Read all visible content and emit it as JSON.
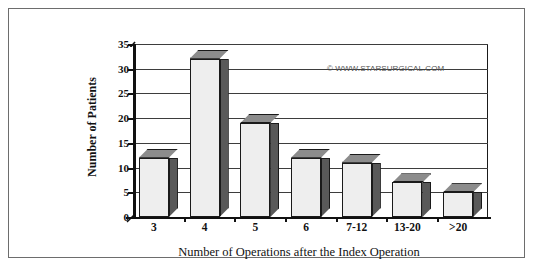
{
  "chart_data": {
    "type": "bar",
    "title": "",
    "xlabel": "Number of  Operations after the Index Operation",
    "ylabel": "Number of Patients",
    "categories": [
      "3",
      "4",
      "5",
      "6",
      "7-12",
      "13-20",
      ">20"
    ],
    "values": [
      12,
      32,
      19,
      12,
      11,
      7,
      5
    ],
    "ylim": [
      0,
      35
    ],
    "ytick_labels": [
      "0",
      "5",
      "10",
      "15",
      "20",
      "25",
      "30",
      "35"
    ],
    "ytick_values": [
      0,
      5,
      10,
      15,
      20,
      25,
      30,
      35
    ],
    "grid": "horizontal",
    "legend": "none",
    "style": "3d-column",
    "annotations": [
      {
        "name": "watermark",
        "text": "© WWW.STARSURGICAL.COM"
      }
    ],
    "colors": {
      "bar_front": "#eeeeee",
      "bar_side": "#595959",
      "bar_top": "#8c8c8c",
      "outline": "#1a1a1a",
      "gridline": "#3d3d3d",
      "axis": "#111111",
      "frame": "#6d6d6d",
      "background": "#ffffff",
      "watermark_text": "#555555"
    }
  }
}
